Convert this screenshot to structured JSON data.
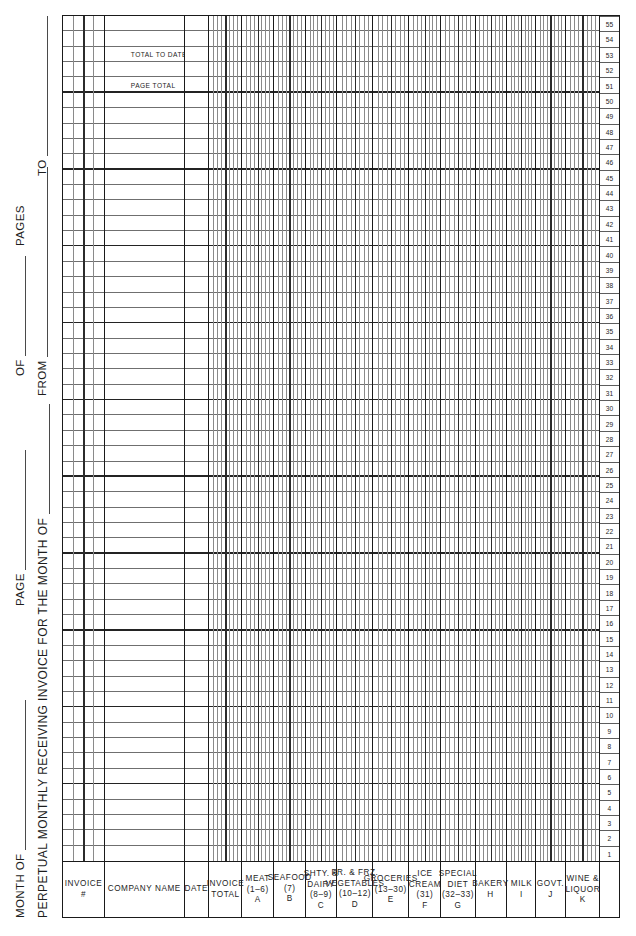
{
  "document": {
    "title": "PERPETUAL MONTHLY RECEIVING INVOICE FOR THE MONTH OF",
    "month_of_label": "MONTH OF",
    "page_label": "PAGE",
    "of_label": "OF",
    "pages_label": "PAGES",
    "from_label": "FROM",
    "to_label": "TO"
  },
  "columns": [
    {
      "key": "invoice_no",
      "lines": [
        "INVOICE",
        "#"
      ],
      "code": "",
      "width": 58,
      "subdiv": 4,
      "type": "text"
    },
    {
      "key": "company_name",
      "lines": [
        "COMPANY NAME"
      ],
      "code": "",
      "width": 112,
      "subdiv": 0,
      "type": "text"
    },
    {
      "key": "date",
      "lines": [
        "DATE"
      ],
      "code": "",
      "width": 34,
      "subdiv": 0,
      "type": "text"
    },
    {
      "key": "invoice_total",
      "lines": [
        "INVOICE",
        "TOTAL"
      ],
      "code": "",
      "width": 46,
      "subdiv": 8,
      "type": "money"
    },
    {
      "key": "meat",
      "lines": [
        "MEAT",
        "(1–6)"
      ],
      "code": "A",
      "width": 44,
      "subdiv": 8,
      "type": "money"
    },
    {
      "key": "seafood",
      "lines": [
        "SEAFOOD",
        "(7)"
      ],
      "code": "B",
      "width": 44,
      "subdiv": 8,
      "type": "money"
    },
    {
      "key": "shty_dairy",
      "lines": [
        "SHTY. &",
        "DAIRY",
        "(8–9)"
      ],
      "code": "C",
      "width": 44,
      "subdiv": 8,
      "type": "money"
    },
    {
      "key": "fr_frz_veg",
      "lines": [
        "FR. & FRZ.",
        "VEGETABLES",
        "(10–12)"
      ],
      "code": "D",
      "width": 50,
      "subdiv": 8,
      "type": "money"
    },
    {
      "key": "groceries",
      "lines": [
        "GROCERIES",
        "(13–30)"
      ],
      "code": "E",
      "width": 50,
      "subdiv": 8,
      "type": "money"
    },
    {
      "key": "ice_cream",
      "lines": [
        "ICE",
        "CREAM",
        "(31)"
      ],
      "code": "F",
      "width": 44,
      "subdiv": 8,
      "type": "money"
    },
    {
      "key": "special_diet",
      "lines": [
        "SPECIAL",
        "DIET",
        "(32–33)"
      ],
      "code": "G",
      "width": 48,
      "subdiv": 8,
      "type": "money"
    },
    {
      "key": "bakery",
      "lines": [
        "BAKERY"
      ],
      "code": "H",
      "width": 44,
      "subdiv": 8,
      "type": "money"
    },
    {
      "key": "milk",
      "lines": [
        "MILK"
      ],
      "code": "I",
      "width": 40,
      "subdiv": 8,
      "type": "money"
    },
    {
      "key": "govt",
      "lines": [
        "GOVT."
      ],
      "code": "J",
      "width": 42,
      "subdiv": 8,
      "type": "money"
    },
    {
      "key": "wine_liquor",
      "lines": [
        "WINE &",
        "LIQUOR"
      ],
      "code": "K",
      "width": 46,
      "subdiv": 8,
      "type": "money"
    }
  ],
  "rows": {
    "count": 55,
    "numbers": [
      1,
      2,
      3,
      4,
      5,
      6,
      7,
      8,
      9,
      10,
      11,
      12,
      13,
      14,
      15,
      16,
      17,
      18,
      19,
      20,
      21,
      22,
      23,
      24,
      25,
      26,
      27,
      28,
      29,
      30,
      31,
      32,
      33,
      34,
      35,
      36,
      37,
      38,
      39,
      40,
      41,
      42,
      43,
      44,
      45,
      46,
      47,
      48,
      49,
      50,
      51,
      52,
      53,
      54,
      55
    ],
    "numstrip_header": ""
  },
  "totals": [
    {
      "row": 51,
      "label": "PAGE TOTAL"
    },
    {
      "row": 53,
      "label": "TOTAL TO DATE"
    }
  ],
  "style": {
    "ink": "#1a1a1a",
    "rule": "#6f6f6f",
    "paper": "#ffffff"
  }
}
